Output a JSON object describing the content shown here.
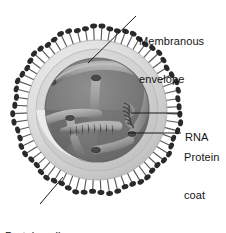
{
  "figure": {
    "type": "labeled-biological-diagram",
    "background_color": "#ffffff"
  },
  "labels": {
    "membranous_envelope": {
      "name": "Membranous envelope",
      "line1": "Membranous",
      "line2": "envelope"
    },
    "rna": {
      "name": "RNA",
      "line1": "RNA"
    },
    "protein_coat": {
      "name": "Protein coat",
      "line1": "Protein",
      "line2": "coat"
    },
    "protein_spike": {
      "name": "Protein spike",
      "line1": "Protein spike"
    }
  },
  "colors": {
    "text": "#141414",
    "leader_line": "#1a1a1a",
    "envelope_outer": "#d8d8d8",
    "envelope_ring": "#c4c4c4",
    "envelope_highlight": "#efefef",
    "interior_dark": "#6f6f6f",
    "interior_mid": "#808080",
    "nucleocapsid": "#a2a2a2",
    "nucleocapsid_shadow": "#5c5c5c",
    "spike_stalk": "#5a5a5a",
    "spike_head": "#2a2a2a"
  },
  "geometry": {
    "virion_center_x": 97,
    "virion_center_y": 110,
    "envelope_radius": 70,
    "coat_radius": 61,
    "interior_radius": 52,
    "spike_count": 64,
    "spike_length": 13
  }
}
